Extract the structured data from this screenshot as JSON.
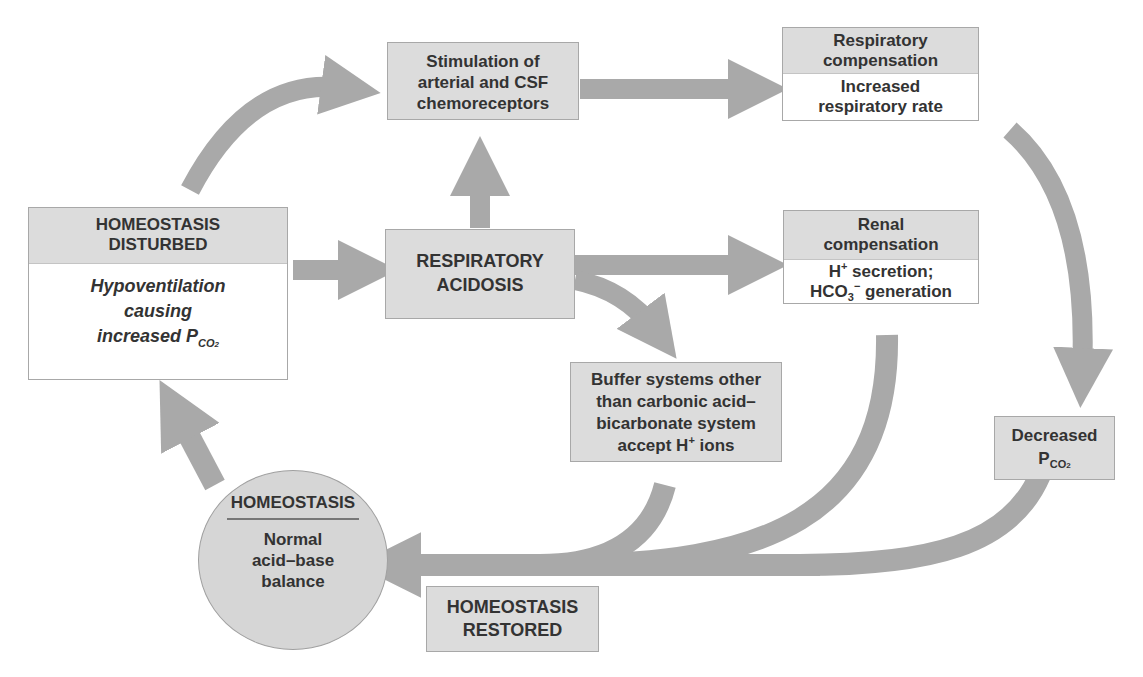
{
  "diagram": {
    "colors": {
      "box_fill": "#dcdcdc",
      "box_body_fill": "#ffffff",
      "arrow": "#a9a9a9",
      "circle_fill": "#d6d6d6",
      "text": "#333333"
    },
    "nodes": {
      "disturbed": {
        "head": "HOMEOSTASIS\nDISTURBED",
        "head_l1": "HOMEOSTASIS",
        "head_l2": "DISTURBED",
        "body_l1": "Hypoventilation",
        "body_l2": "causing",
        "body_l3": "increased P",
        "body_sub": "CO",
        "body_sub2": "2"
      },
      "stimulation": {
        "l1": "Stimulation of",
        "l2": "arterial and CSF",
        "l3": "chemoreceptors"
      },
      "resp_comp": {
        "head_l1": "Respiratory",
        "head_l2": "compensation",
        "body_l1": "Increased",
        "body_l2": "respiratory rate"
      },
      "acidosis": {
        "l1": "RESPIRATORY",
        "l2": "ACIDOSIS"
      },
      "renal": {
        "head_l1": "Renal",
        "head_l2": "compensation",
        "body_l1a": "H",
        "body_l1sup": "+",
        "body_l1b": " secretion;",
        "body_l2a": "HCO",
        "body_l2sub": "3",
        "body_l2sup": "−",
        "body_l2b": " generation"
      },
      "buffer": {
        "l1": "Buffer systems other",
        "l2": "than carbonic acid–",
        "l3": "bicarbonate system",
        "l4a": "accept H",
        "l4sup": "+",
        "l4b": " ions"
      },
      "decreased": {
        "l1": "Decreased",
        "l2": "P",
        "l2sub": "CO",
        "l2sub2": "2"
      },
      "homeostasis": {
        "title": "HOMEOSTASIS",
        "l1": "Normal",
        "l2": "acid–base",
        "l3": "balance"
      },
      "restored": {
        "l1": "HOMEOSTASIS",
        "l2": "RESTORED"
      }
    },
    "edges": [
      {
        "from": "disturbed",
        "to": "stimulation",
        "shape": "curved"
      },
      {
        "from": "disturbed",
        "to": "acidosis",
        "shape": "straight"
      },
      {
        "from": "acidosis",
        "to": "stimulation",
        "shape": "straight"
      },
      {
        "from": "stimulation",
        "to": "resp_comp",
        "shape": "straight"
      },
      {
        "from": "acidosis",
        "to": "renal",
        "shape": "straight"
      },
      {
        "from": "acidosis",
        "to": "buffer",
        "shape": "curved"
      },
      {
        "from": "resp_comp",
        "to": "decreased",
        "shape": "curved"
      },
      {
        "from": "renal",
        "to": "homeostasis",
        "shape": "curved"
      },
      {
        "from": "buffer",
        "to": "homeostasis",
        "shape": "curved"
      },
      {
        "from": "decreased",
        "to": "homeostasis",
        "shape": "curved"
      },
      {
        "from": "homeostasis",
        "to": "disturbed",
        "shape": "straight"
      }
    ]
  }
}
